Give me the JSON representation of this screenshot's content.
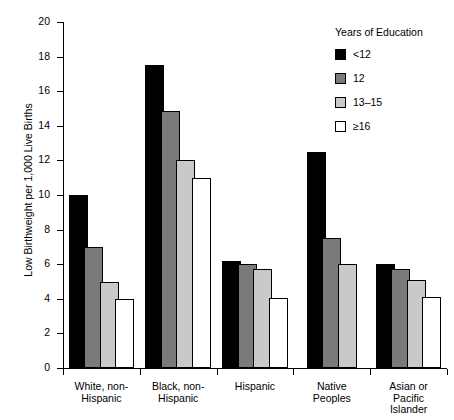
{
  "chart_data": {
    "type": "bar",
    "title": "",
    "xlabel": "",
    "ylabel": "Low Birthweight per 1,000 Live Births",
    "ylim": [
      0,
      20
    ],
    "ytick_step": 2,
    "yticks": [
      0,
      2,
      4,
      6,
      8,
      10,
      12,
      14,
      16,
      18,
      20
    ],
    "grid": false,
    "legend_position": "top-right",
    "legend_title": "Years of Education",
    "categories": [
      "White, non-\nHispanic",
      "Black, non-\nHispanic",
      "Hispanic",
      "Native\nPeoples",
      "Asian or\nPacific\nIslander"
    ],
    "series": [
      {
        "name": "<12",
        "color": "#000000",
        "values": [
          10.0,
          17.5,
          6.2,
          12.5,
          6.0
        ]
      },
      {
        "name": "12",
        "color": "#7a7a7a",
        "values": [
          7.0,
          14.85,
          6.0,
          7.5,
          5.7
        ]
      },
      {
        "name": "13–15",
        "color": "#c9c9c9",
        "values": [
          5.0,
          12.0,
          5.7,
          6.0,
          5.1
        ]
      },
      {
        "name": "≥16",
        "color": "#ffffff",
        "values": [
          4.0,
          11.0,
          4.05,
          null,
          4.1
        ]
      }
    ]
  },
  "legend": {
    "title": "Years of Education",
    "items": [
      {
        "label": "<12"
      },
      {
        "label": "12"
      },
      {
        "label": "13–15"
      },
      {
        "label": "≥16"
      }
    ]
  },
  "axes": {
    "y_title": "Low Birthweight per 1,000 Live Births",
    "y_labels": [
      "20",
      "18",
      "16",
      "14",
      "12",
      "10",
      "8",
      "6",
      "4",
      "2",
      "0"
    ],
    "x_labels": [
      "White, non-\nHispanic",
      "Black, non-\nHispanic",
      "Hispanic",
      "Native\nPeoples",
      "Asian or\nPacific\nIslander"
    ]
  }
}
